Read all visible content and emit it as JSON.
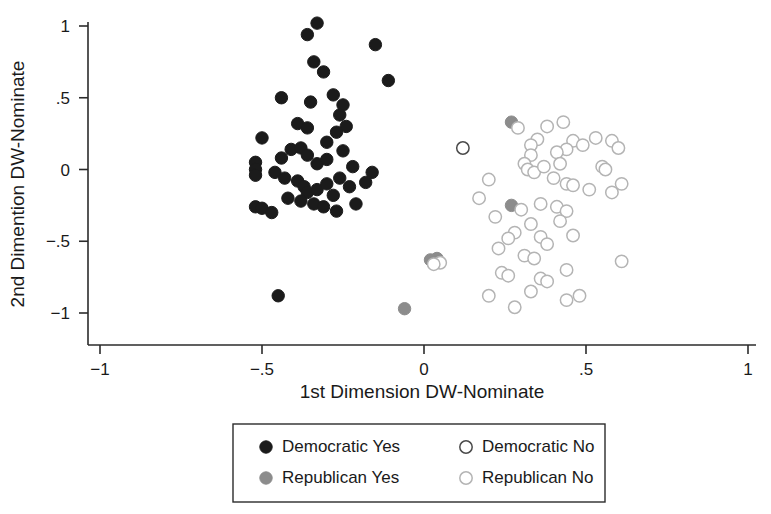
{
  "chart_data": {
    "type": "scatter",
    "title": "",
    "xlabel": "1st Dimension DW-Nominate",
    "ylabel": "2nd Dimention DW-Nominate",
    "xlim": [
      -1,
      1
    ],
    "ylim": [
      -1,
      1
    ],
    "xticks": [
      -1,
      -0.5,
      0,
      0.5,
      1
    ],
    "yticks": [
      -1,
      -0.5,
      0,
      0.5,
      1
    ],
    "xticklabels": [
      "−1",
      "−.5",
      "0",
      ".5",
      "1"
    ],
    "yticklabels": [
      "−1",
      "−.5",
      "0",
      ".5",
      "1"
    ],
    "grid": false,
    "legend_position": "below-center",
    "series": [
      {
        "name": "Democratic Yes",
        "marker": "filled-circle",
        "color": "#1b1b1b",
        "edge_color": "#1b1b1b",
        "points": [
          [
            -0.33,
            1.02
          ],
          [
            -0.36,
            0.94
          ],
          [
            -0.15,
            0.87
          ],
          [
            -0.11,
            0.62
          ],
          [
            -0.34,
            0.75
          ],
          [
            -0.31,
            0.68
          ],
          [
            -0.44,
            0.5
          ],
          [
            -0.35,
            0.47
          ],
          [
            -0.28,
            0.52
          ],
          [
            -0.25,
            0.45
          ],
          [
            -0.26,
            0.38
          ],
          [
            -0.24,
            0.3
          ],
          [
            -0.27,
            0.26
          ],
          [
            -0.39,
            0.32
          ],
          [
            -0.36,
            0.29
          ],
          [
            -0.3,
            0.19
          ],
          [
            -0.5,
            0.22
          ],
          [
            -0.41,
            0.14
          ],
          [
            -0.38,
            0.15
          ],
          [
            -0.44,
            0.08
          ],
          [
            -0.36,
            0.1
          ],
          [
            -0.33,
            0.04
          ],
          [
            -0.3,
            0.07
          ],
          [
            -0.25,
            0.13
          ],
          [
            -0.22,
            0.02
          ],
          [
            -0.52,
            0.05
          ],
          [
            -0.52,
            0.0
          ],
          [
            -0.52,
            -0.04
          ],
          [
            -0.46,
            -0.02
          ],
          [
            -0.43,
            -0.06
          ],
          [
            -0.39,
            -0.08
          ],
          [
            -0.37,
            -0.12
          ],
          [
            -0.36,
            -0.16
          ],
          [
            -0.33,
            -0.14
          ],
          [
            -0.3,
            -0.1
          ],
          [
            -0.28,
            -0.18
          ],
          [
            -0.26,
            -0.06
          ],
          [
            -0.23,
            -0.12
          ],
          [
            -0.18,
            -0.09
          ],
          [
            -0.16,
            -0.02
          ],
          [
            -0.42,
            -0.2
          ],
          [
            -0.38,
            -0.22
          ],
          [
            -0.34,
            -0.24
          ],
          [
            -0.31,
            -0.26
          ],
          [
            -0.52,
            -0.26
          ],
          [
            -0.5,
            -0.27
          ],
          [
            -0.47,
            -0.3
          ],
          [
            -0.27,
            -0.29
          ],
          [
            -0.21,
            -0.24
          ],
          [
            -0.45,
            -0.88
          ]
        ]
      },
      {
        "name": "Democratic No",
        "marker": "open-circle",
        "color": "#ffffff",
        "edge_color": "#4a4a4a",
        "points": [
          [
            0.12,
            0.15
          ]
        ]
      },
      {
        "name": "Republican Yes",
        "marker": "filled-circle",
        "color": "#8c8c8c",
        "edge_color": "#8c8c8c",
        "points": [
          [
            0.27,
            0.33
          ],
          [
            0.27,
            -0.25
          ],
          [
            0.04,
            -0.62
          ],
          [
            0.02,
            -0.63
          ],
          [
            -0.06,
            -0.97
          ]
        ]
      },
      {
        "name": "Republican No",
        "marker": "open-circle",
        "color": "#ffffff",
        "edge_color": "#b4b4b4",
        "points": [
          [
            0.29,
            0.29
          ],
          [
            0.38,
            0.3
          ],
          [
            0.43,
            0.33
          ],
          [
            0.35,
            0.21
          ],
          [
            0.33,
            0.17
          ],
          [
            0.46,
            0.2
          ],
          [
            0.49,
            0.17
          ],
          [
            0.53,
            0.22
          ],
          [
            0.58,
            0.2
          ],
          [
            0.6,
            0.15
          ],
          [
            0.44,
            0.14
          ],
          [
            0.41,
            0.12
          ],
          [
            0.33,
            0.1
          ],
          [
            0.31,
            0.04
          ],
          [
            0.32,
            0.0
          ],
          [
            0.34,
            -0.02
          ],
          [
            0.37,
            0.02
          ],
          [
            0.42,
            0.04
          ],
          [
            0.55,
            0.02
          ],
          [
            0.56,
            0.0
          ],
          [
            0.4,
            -0.06
          ],
          [
            0.2,
            -0.07
          ],
          [
            0.44,
            -0.1
          ],
          [
            0.46,
            -0.11
          ],
          [
            0.61,
            -0.1
          ],
          [
            0.51,
            -0.14
          ],
          [
            0.58,
            -0.16
          ],
          [
            0.17,
            -0.2
          ],
          [
            0.3,
            -0.28
          ],
          [
            0.36,
            -0.24
          ],
          [
            0.41,
            -0.26
          ],
          [
            0.44,
            -0.29
          ],
          [
            0.22,
            -0.33
          ],
          [
            0.33,
            -0.38
          ],
          [
            0.42,
            -0.36
          ],
          [
            0.28,
            -0.44
          ],
          [
            0.26,
            -0.48
          ],
          [
            0.36,
            -0.47
          ],
          [
            0.46,
            -0.46
          ],
          [
            0.38,
            -0.52
          ],
          [
            0.23,
            -0.55
          ],
          [
            0.05,
            -0.65
          ],
          [
            0.03,
            -0.66
          ],
          [
            0.31,
            -0.6
          ],
          [
            0.34,
            -0.62
          ],
          [
            0.61,
            -0.64
          ],
          [
            0.44,
            -0.7
          ],
          [
            0.24,
            -0.72
          ],
          [
            0.26,
            -0.74
          ],
          [
            0.36,
            -0.76
          ],
          [
            0.38,
            -0.78
          ],
          [
            0.33,
            -0.85
          ],
          [
            0.2,
            -0.88
          ],
          [
            0.44,
            -0.91
          ],
          [
            0.28,
            -0.96
          ],
          [
            0.48,
            -0.88
          ]
        ]
      }
    ]
  },
  "legend": {
    "entries": [
      {
        "label": "Democratic Yes",
        "series": 0
      },
      {
        "label": "Democratic No",
        "series": 1
      },
      {
        "label": "Republican Yes",
        "series": 2
      },
      {
        "label": "Republican No",
        "series": 3
      }
    ]
  }
}
